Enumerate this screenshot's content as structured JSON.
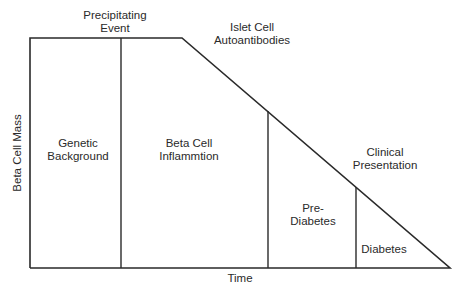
{
  "diagram": {
    "y_axis_label": "Beta Cell Mass",
    "x_axis_label": "Time",
    "events": {
      "precipitating": [
        "Precipitating",
        "Event"
      ],
      "islet": [
        "Islet Cell",
        "Autoantibodies"
      ],
      "clinical": [
        "Clinical",
        "Presentation"
      ]
    },
    "stages": [
      {
        "line1": "Genetic",
        "line2": "Background"
      },
      {
        "line1": "Beta Cell",
        "line2": "Inflammtion"
      },
      {
        "line1": "Pre-",
        "line2": "Diabetes"
      },
      {
        "line1": "Diabetes",
        "line2": ""
      }
    ],
    "line_color": "#2a2a2a"
  }
}
